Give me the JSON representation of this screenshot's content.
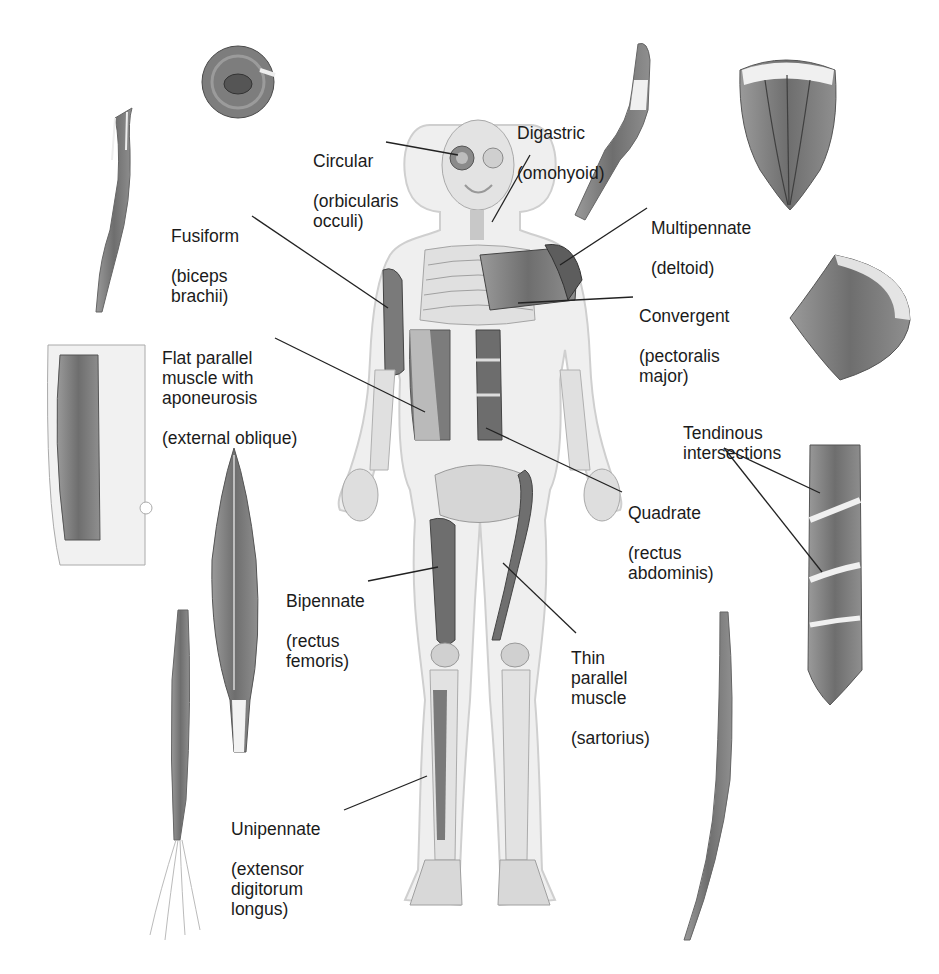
{
  "labels": {
    "circular": {
      "type": "Circular",
      "example": "(orbicularis\nocculi)"
    },
    "digastric": {
      "type": "Digastric",
      "example": "(omohyoid)"
    },
    "fusiform": {
      "type": "Fusiform",
      "example": "(biceps\nbrachii)"
    },
    "multipennate": {
      "type": "Multipennate",
      "example": "(deltoid)"
    },
    "convergent": {
      "type": "Convergent",
      "example": "(pectoralis\nmajor)"
    },
    "flat_parallel": {
      "type": "Flat parallel\nmuscle with\naponeurosis",
      "example": "(external oblique)"
    },
    "tendinous": {
      "type": "Tendinous\nintersections",
      "example": ""
    },
    "quadrate": {
      "type": "Quadrate",
      "example": "(rectus\nabdominis)"
    },
    "bipennate": {
      "type": "Bipennate",
      "example": "(rectus\nfemoris)"
    },
    "thin_parallel": {
      "type": "Thin\nparallel\nmuscle",
      "example": "(sartorius)"
    },
    "unipennate": {
      "type": "Unipennate",
      "example": "(extensor\ndigitorum\nlongus)"
    }
  },
  "colors": {
    "muscle": "#7a7a7a",
    "muscle_dark": "#555555",
    "tendon": "#eeeeee",
    "skin": "#e8e8e8",
    "bone": "#d9d9d9",
    "line": "#222222"
  }
}
